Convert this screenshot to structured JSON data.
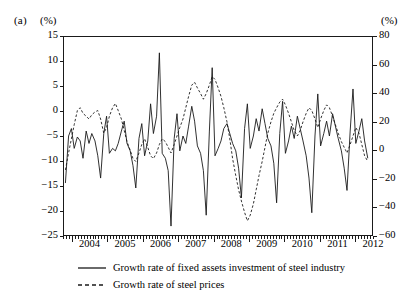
{
  "figure": {
    "panel_label": "(a)",
    "unit_left": "(%)",
    "unit_right": "(%)"
  },
  "chart_data": {
    "type": "line",
    "title": "",
    "xlabel": "",
    "ylabel": "(%)",
    "y2label": "(%)",
    "grid": false,
    "legend_position": "bottom",
    "xlim": [
      2003.75,
      2012.5
    ],
    "ylim": [
      -25,
      15
    ],
    "y2lim": [
      -60,
      80
    ],
    "yticks": [
      15,
      10,
      5,
      0,
      -5,
      -10,
      -15,
      -20,
      -25
    ],
    "ytick_labels": [
      "15",
      "10",
      "5",
      "0",
      "−5",
      "−10",
      "−15",
      "−20",
      "−25"
    ],
    "y2ticks": [
      80,
      60,
      40,
      20,
      0,
      -20,
      -40,
      -60
    ],
    "y2tick_labels": [
      "80",
      "60",
      "40",
      "20",
      "0",
      "−20",
      "−40",
      "−60"
    ],
    "xticks": [
      2004,
      2005,
      2006,
      2007,
      2008,
      2009,
      2010,
      2011,
      2012
    ],
    "xtick_labels": [
      "2004",
      "2005",
      "2006",
      "2007",
      "2008",
      "2009",
      "2010",
      "2011",
      "2012"
    ],
    "minor_xticks_per_year": 12,
    "series": [
      {
        "name": "Growth rate of fixed assets investment of steel industry",
        "style": "solid",
        "axis": "left",
        "color": "#1a1a1a",
        "x": [
          2003.79,
          2003.88,
          2003.96,
          2004.04,
          2004.13,
          2004.21,
          2004.29,
          2004.38,
          2004.46,
          2004.54,
          2004.63,
          2004.71,
          2004.79,
          2004.88,
          2004.96,
          2005.04,
          2005.13,
          2005.21,
          2005.29,
          2005.38,
          2005.46,
          2005.54,
          2005.63,
          2005.71,
          2005.79,
          2005.88,
          2005.96,
          2006.04,
          2006.13,
          2006.21,
          2006.29,
          2006.38,
          2006.46,
          2006.54,
          2006.63,
          2006.71,
          2006.79,
          2006.88,
          2006.96,
          2007.04,
          2007.13,
          2007.21,
          2007.29,
          2007.38,
          2007.46,
          2007.54,
          2007.63,
          2007.71,
          2007.79,
          2007.88,
          2007.96,
          2008.04,
          2008.13,
          2008.21,
          2008.29,
          2008.38,
          2008.46,
          2008.54,
          2008.63,
          2008.71,
          2008.79,
          2008.88,
          2008.96,
          2009.04,
          2009.13,
          2009.21,
          2009.29,
          2009.38,
          2009.46,
          2009.54,
          2009.63,
          2009.71,
          2009.79,
          2009.88,
          2009.96,
          2010.04,
          2010.13,
          2010.21,
          2010.29,
          2010.38,
          2010.46,
          2010.54,
          2010.63,
          2010.71,
          2010.79,
          2010.88,
          2010.96,
          2011.04,
          2011.13,
          2011.21,
          2011.29,
          2011.38,
          2011.46,
          2011.54,
          2011.63,
          2011.71,
          2011.79,
          2011.88,
          2011.96,
          2012.04,
          2012.13,
          2012.21,
          2012.29,
          2012.38
        ],
        "y": [
          -14.5,
          -5.0,
          -3.5,
          -7.5,
          -5.2,
          -6.0,
          -9.5,
          -4.0,
          -6.5,
          -4.5,
          -6.0,
          -9.0,
          -13.5,
          -4.5,
          -1.0,
          -8.5,
          -7.5,
          -8.0,
          -6.5,
          -4.0,
          -2.0,
          -6.5,
          -8.0,
          -11.0,
          -15.5,
          -5.5,
          -2.5,
          -9.0,
          -6.0,
          1.5,
          -4.5,
          -1.0,
          11.8,
          -8.5,
          -9.5,
          -12.0,
          -23.2,
          -5.5,
          -0.5,
          -8.0,
          -5.0,
          -6.5,
          -3.0,
          1.0,
          -2.0,
          -7.0,
          -8.5,
          -12.0,
          -21.0,
          -4.0,
          8.8,
          -9.0,
          -7.5,
          -6.0,
          -3.5,
          -2.5,
          -4.5,
          -6.5,
          -8.0,
          -11.5,
          -17.5,
          -3.5,
          1.5,
          -7.5,
          -5.0,
          -1.5,
          -4.0,
          0.5,
          -2.5,
          -5.5,
          -7.0,
          -10.5,
          -18.5,
          -4.5,
          2.0,
          -8.5,
          -6.0,
          -3.0,
          -5.5,
          -1.0,
          -3.5,
          -6.0,
          -9.0,
          -13.5,
          -20.5,
          -5.0,
          3.5,
          -7.0,
          -4.5,
          -2.0,
          -5.0,
          -0.5,
          -3.0,
          -5.5,
          -8.0,
          -11.5,
          -16.0,
          -4.0,
          4.5,
          -6.5,
          -4.0,
          -1.5,
          -6.0,
          -9.5
        ]
      },
      {
        "name": "Growth rate of steel prices",
        "style": "dashed",
        "axis": "right",
        "color": "#1a1a1a",
        "x": [
          2003.79,
          2003.88,
          2003.96,
          2004.04,
          2004.13,
          2004.21,
          2004.29,
          2004.38,
          2004.46,
          2004.54,
          2004.63,
          2004.71,
          2004.79,
          2004.88,
          2004.96,
          2005.04,
          2005.13,
          2005.21,
          2005.29,
          2005.38,
          2005.46,
          2005.54,
          2005.63,
          2005.71,
          2005.79,
          2005.88,
          2005.96,
          2006.04,
          2006.13,
          2006.21,
          2006.29,
          2006.38,
          2006.46,
          2006.54,
          2006.63,
          2006.71,
          2006.79,
          2006.88,
          2006.96,
          2007.04,
          2007.13,
          2007.21,
          2007.29,
          2007.38,
          2007.46,
          2007.54,
          2007.63,
          2007.71,
          2007.79,
          2007.88,
          2007.96,
          2008.04,
          2008.13,
          2008.21,
          2008.29,
          2008.38,
          2008.46,
          2008.54,
          2008.63,
          2008.71,
          2008.79,
          2008.88,
          2008.96,
          2009.04,
          2009.13,
          2009.21,
          2009.29,
          2009.38,
          2009.46,
          2009.54,
          2009.63,
          2009.71,
          2009.79,
          2009.88,
          2009.96,
          2010.04,
          2010.13,
          2010.21,
          2010.29,
          2010.38,
          2010.46,
          2010.54,
          2010.63,
          2010.71,
          2010.79,
          2010.88,
          2010.96,
          2011.04,
          2011.13,
          2011.21,
          2011.29,
          2011.38,
          2011.46,
          2011.54,
          2011.63,
          2011.71,
          2011.79,
          2011.88,
          2011.96,
          2012.04,
          2012.13,
          2012.21,
          2012.29,
          2012.38
        ],
        "y": [
          -14.0,
          -2.0,
          8.0,
          18.0,
          28.0,
          30.0,
          26.0,
          24.0,
          22.0,
          25.0,
          27.0,
          28.0,
          22.0,
          12.0,
          16.0,
          24.0,
          30.0,
          33.0,
          28.0,
          22.0,
          14.0,
          6.0,
          0.0,
          -6.0,
          -8.0,
          -2.0,
          4.0,
          8.0,
          2.0,
          -4.0,
          -6.0,
          -2.0,
          4.0,
          8.0,
          6.0,
          2.0,
          -2.0,
          4.0,
          10.0,
          16.0,
          22.0,
          30.0,
          38.0,
          46.0,
          48.0,
          44.0,
          40.0,
          36.0,
          40.0,
          46.0,
          52.0,
          50.0,
          44.0,
          38.0,
          30.0,
          20.0,
          8.0,
          -6.0,
          -18.0,
          -28.0,
          -36.0,
          -44.0,
          -50.0,
          -46.0,
          -38.0,
          -28.0,
          -18.0,
          -8.0,
          2.0,
          12.0,
          20.0,
          26.0,
          30.0,
          34.0,
          36.0,
          32.0,
          26.0,
          20.0,
          14.0,
          10.0,
          14.0,
          20.0,
          26.0,
          30.0,
          28.0,
          22.0,
          16.0,
          22.0,
          28.0,
          32.0,
          30.0,
          24.0,
          18.0,
          12.0,
          6.0,
          2.0,
          -2.0,
          4.0,
          10.0,
          16.0,
          12.0,
          4.0,
          -4.0,
          -8.0
        ]
      }
    ]
  },
  "legend": {
    "items": [
      {
        "label": "Growth rate of fixed assets investment of steel industry",
        "style": "solid"
      },
      {
        "label": "Growth rate of steel prices",
        "style": "dashed"
      }
    ]
  }
}
